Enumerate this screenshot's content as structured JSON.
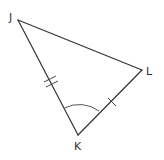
{
  "diagram": {
    "type": "triangle",
    "stroke_color": "#333333",
    "arc_color": "#555555",
    "vertices": [
      {
        "label": "J",
        "x": 18,
        "y": 20,
        "label_x": 9,
        "label_y": 21
      },
      {
        "label": "L",
        "x": 142,
        "y": 70,
        "label_x": 146,
        "label_y": 75
      },
      {
        "label": "K",
        "x": 78,
        "y": 135,
        "label_x": 74,
        "label_y": 150
      }
    ],
    "sides": [
      {
        "from": "J",
        "to": "L",
        "tick_marks": 0
      },
      {
        "from": "J",
        "to": "K",
        "tick_marks": 2
      },
      {
        "from": "K",
        "to": "L",
        "tick_marks": 1
      }
    ],
    "angle_marks": [
      {
        "vertex": "K",
        "arcs": 1
      }
    ]
  }
}
